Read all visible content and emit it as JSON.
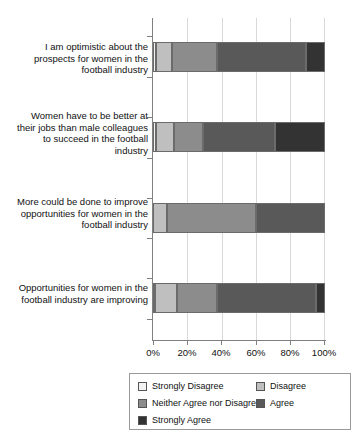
{
  "chart_data": {
    "type": "bar",
    "orientation": "horizontal",
    "stacked": true,
    "stack_mode": "percent",
    "title": "",
    "xlabel": "",
    "ylabel": "",
    "xlim": [
      0,
      100
    ],
    "grid": true,
    "legend_position": "bottom",
    "xticks": [
      "0%",
      "20%",
      "40%",
      "60%",
      "80%",
      "100%"
    ],
    "xtick_values": [
      0,
      20,
      40,
      60,
      80,
      100
    ],
    "categories": [
      "I am optimistic about the prospects for women in the football industry",
      "Women have to be better at their jobs than male colleagues to succeed in the football industry",
      "More could be done to improve opportunities for women in the football industry",
      "Opportunities for women in the football industry are improving"
    ],
    "series": [
      {
        "name": "Strongly Disagree",
        "color": "#f2f2f2",
        "values": [
          2,
          2,
          0,
          1
        ]
      },
      {
        "name": "Disagree",
        "color": "#bfbfbf",
        "values": [
          9,
          10,
          8,
          13
        ]
      },
      {
        "name": "Neither Agree nor Disagree",
        "color": "#8c8c8c",
        "values": [
          26,
          17,
          52,
          23
        ]
      },
      {
        "name": "Agree",
        "color": "#595959",
        "values": [
          52,
          42,
          40,
          58
        ]
      },
      {
        "name": "Strongly Agree",
        "color": "#333333",
        "values": [
          11,
          29,
          0,
          5
        ]
      }
    ]
  },
  "axis": {
    "tick_labels": [
      "0%",
      "20%",
      "40%",
      "60%",
      "80%",
      "100%"
    ]
  },
  "categories": {
    "c0": "I am optimistic about the prospects for women in the football industry",
    "c1": "Women have to be better at their jobs than male colleagues to succeed in the football industry",
    "c2": "More could be done to improve opportunities for women in the football industry",
    "c3": "Opportunities for women in the football industry are improving"
  },
  "legend": {
    "items": [
      {
        "label": "Strongly Disagree",
        "color": "#f2f2f2"
      },
      {
        "label": "Disagree",
        "color": "#bfbfbf"
      },
      {
        "label": "Neither Agree nor Disagree",
        "color": "#8c8c8c"
      },
      {
        "label": "Agree",
        "color": "#595959"
      },
      {
        "label": "Strongly Agree",
        "color": "#333333"
      }
    ]
  }
}
